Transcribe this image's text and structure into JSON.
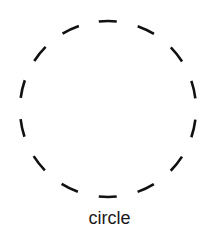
{
  "diagram": {
    "shape": "circle",
    "style": "dashed",
    "stroke_color": "#111111",
    "dash_count": 14,
    "label": "circle"
  }
}
